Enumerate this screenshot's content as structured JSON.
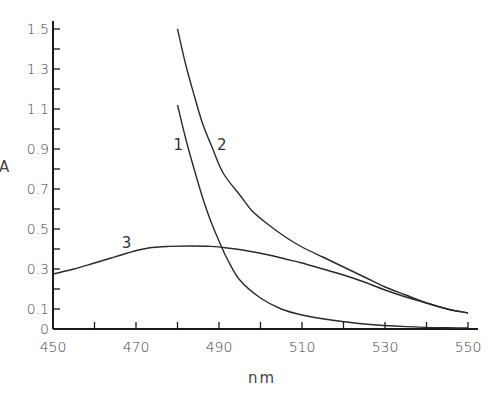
{
  "chart_data": {
    "type": "line",
    "title": "",
    "xlabel": "nm",
    "ylabel": "A",
    "xlim": [
      450,
      550
    ],
    "ylim": [
      0,
      1.5
    ],
    "grid": false,
    "legend": "none (curves labelled inline with numbers 1, 2, 3)",
    "x_ticks": [
      450,
      470,
      490,
      510,
      530,
      550
    ],
    "x_minor_ticks": [
      460,
      480,
      500,
      520,
      540
    ],
    "y_tick_labels": [
      "0",
      "0.1",
      "0.3",
      "0.5",
      "0.7",
      "0.9",
      "1.1",
      "1.3",
      "1.5"
    ],
    "y_tick_values": [
      0,
      0.1,
      0.3,
      0.5,
      0.7,
      0.9,
      1.1,
      1.3,
      1.5
    ],
    "y_minor_ticks": [
      0.2,
      0.4,
      0.6,
      0.8,
      1.0,
      1.2,
      1.4
    ],
    "series": [
      {
        "name": "1",
        "label_pos": {
          "x": 480,
          "y": 0.92
        },
        "points": [
          [
            480,
            1.12
          ],
          [
            482,
            0.95
          ],
          [
            484,
            0.8
          ],
          [
            486,
            0.66
          ],
          [
            488,
            0.54
          ],
          [
            490,
            0.44
          ],
          [
            492,
            0.35
          ],
          [
            495,
            0.245
          ],
          [
            500,
            0.155
          ],
          [
            505,
            0.1
          ],
          [
            510,
            0.07
          ],
          [
            517,
            0.045
          ],
          [
            525,
            0.025
          ],
          [
            535,
            0.012
          ],
          [
            545,
            0.006
          ],
          [
            550,
            0.005
          ]
        ]
      },
      {
        "name": "2",
        "label_pos": {
          "x": 490.5,
          "y": 0.92
        },
        "points": [
          [
            480,
            1.5
          ],
          [
            482,
            1.32
          ],
          [
            484,
            1.17
          ],
          [
            486,
            1.03
          ],
          [
            488.5,
            0.9
          ],
          [
            491,
            0.78
          ],
          [
            495,
            0.67
          ],
          [
            498,
            0.59
          ],
          [
            502,
            0.52
          ],
          [
            506,
            0.46
          ],
          [
            510,
            0.41
          ],
          [
            515,
            0.36
          ],
          [
            520,
            0.31
          ],
          [
            525,
            0.26
          ],
          [
            530,
            0.21
          ],
          [
            535,
            0.17
          ],
          [
            540,
            0.13
          ],
          [
            545,
            0.1
          ],
          [
            550,
            0.08
          ]
        ]
      },
      {
        "name": "3",
        "label_pos": {
          "x": 467.5,
          "y": 0.43
        },
        "points": [
          [
            450,
            0.275
          ],
          [
            455,
            0.3
          ],
          [
            460,
            0.33
          ],
          [
            464,
            0.355
          ],
          [
            468,
            0.38
          ],
          [
            473,
            0.405
          ],
          [
            478,
            0.413
          ],
          [
            483,
            0.415
          ],
          [
            488,
            0.413
          ],
          [
            492,
            0.405
          ],
          [
            497,
            0.39
          ],
          [
            502,
            0.37
          ],
          [
            506,
            0.35
          ],
          [
            510,
            0.33
          ],
          [
            515,
            0.3
          ],
          [
            520,
            0.27
          ],
          [
            525,
            0.235
          ],
          [
            530,
            0.195
          ],
          [
            535,
            0.16
          ],
          [
            540,
            0.13
          ],
          [
            545,
            0.1
          ],
          [
            550,
            0.08
          ]
        ]
      }
    ]
  }
}
